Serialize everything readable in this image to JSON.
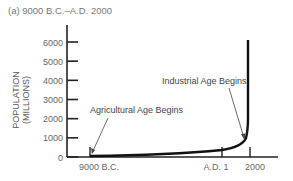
{
  "chart_data": {
    "type": "line",
    "title": "(a) 9000 B.C.–A.D. 2000",
    "xlabel": "",
    "ylabel": "POPULATION (MILLIONS)",
    "ylabel_lines": [
      "POPULATION",
      "(MILLIONS)"
    ],
    "ylim": [
      0,
      6000
    ],
    "yticks": [
      0,
      1000,
      2000,
      3000,
      4000,
      5000,
      6000
    ],
    "xtick_labels": [
      "9000 B.C.",
      "A.D. 1",
      "2000"
    ],
    "x_years": [
      -9000,
      1,
      2000
    ],
    "grid": false,
    "series": [
      {
        "name": "World population",
        "x": [
          -9000,
          -6000,
          -4000,
          -2000,
          1,
          1000,
          1500,
          1750,
          1850,
          1900,
          1950,
          1975,
          2000
        ],
        "values": [
          5,
          10,
          20,
          40,
          200,
          300,
          450,
          750,
          1200,
          1650,
          2500,
          4000,
          6000
        ]
      }
    ],
    "annotations": [
      {
        "text": "Agricultural Age Begins",
        "x": -9000,
        "y": 5
      },
      {
        "text": "Industrial Age Begins",
        "x": 1750,
        "y": 750
      }
    ]
  }
}
